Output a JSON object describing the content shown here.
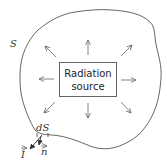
{
  "diagram": {
    "surface_label": "S",
    "source_label_line1": "Radiation",
    "source_label_line2": "source",
    "element_label": "dS",
    "vector_I_label": "I",
    "vector_n_label": "n",
    "arrow_directions": [
      "up",
      "up-right",
      "right",
      "down-right",
      "down",
      "down-left",
      "left",
      "up-left"
    ],
    "colors": {
      "stroke": "#555555",
      "background": "#ffffff"
    }
  }
}
